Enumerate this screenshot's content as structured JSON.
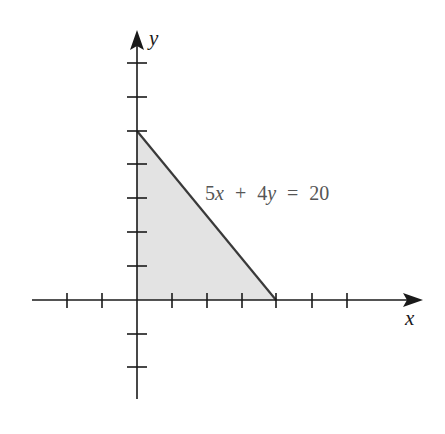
{
  "diagram": {
    "type": "graph-of-linear-inequality-region",
    "x_axis_label": "x",
    "y_axis_label": "y",
    "equation": {
      "coef_x": "5",
      "var_x": "x",
      "plus": "+",
      "coef_y": "4",
      "var_y": "y",
      "equals": "=",
      "rhs": "20"
    },
    "origin_px": [
      137,
      300
    ],
    "unit_px_x": 34.75,
    "unit_px_y": 33.8,
    "x_ticks": [
      -3,
      -2,
      1,
      2,
      3,
      4,
      5,
      6
    ],
    "y_ticks": [
      -2,
      -1,
      1,
      2,
      3,
      4,
      5,
      6,
      7
    ],
    "shaded_region_vertices": [
      [
        0,
        0
      ],
      [
        0,
        5
      ],
      [
        4,
        0
      ]
    ],
    "colors": {
      "axis": "#1a1a1a",
      "line": "#3a3a3a",
      "fill": "#e3e3e3",
      "equation_text": "#555555"
    }
  }
}
